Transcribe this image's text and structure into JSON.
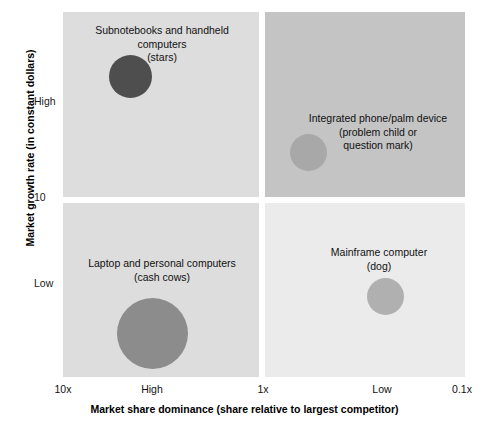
{
  "chart_data": {
    "type": "scatter",
    "title": "",
    "subtitle": "",
    "xlabel": "Market share dominance (share relative to largest competitor)",
    "ylabel": "Market growth rate (in constant dollars)",
    "x_ticks": [
      "10x",
      "High",
      "1x",
      "Low",
      "0.1x"
    ],
    "y_ticks": [
      "High",
      "10",
      "Low"
    ],
    "xlim": [
      "10x",
      "0.1x"
    ],
    "ylim": [
      "Low",
      "High"
    ],
    "grid": false,
    "legend": "none",
    "quadrants": [
      {
        "id": "stars",
        "position": "top-left",
        "fill": "#dddddd",
        "caption": "Subnotebooks and handheld\ncomputers\n(stars)",
        "bubble": {
          "label": "Subnotebooks and handheld computers",
          "category": "stars",
          "x": "High share",
          "y": "High growth",
          "size": 43,
          "color": "#4e4e4e"
        }
      },
      {
        "id": "question",
        "position": "top-right",
        "fill": "#c4c4c4",
        "caption": "Integrated phone/palm device\n(problem child or\nquestion mark)",
        "bubble": {
          "label": "Integrated phone/palm device",
          "category": "problem child or question mark",
          "x": "Low share",
          "y": "High growth",
          "size": 37,
          "color": "#a8a8a8"
        }
      },
      {
        "id": "cashcow",
        "position": "bottom-left",
        "fill": "#dddddd",
        "caption": "Laptop and personal computers\n(cash cows)",
        "bubble": {
          "label": "Laptop and personal computers",
          "category": "cash cows",
          "x": "High share",
          "y": "Low growth",
          "size": 71,
          "color": "#8c8c8c"
        }
      },
      {
        "id": "dog",
        "position": "bottom-right",
        "fill": "#ebebeb",
        "caption": "Mainframe computer\n(dog)",
        "bubble": {
          "label": "Mainframe computer",
          "category": "dog",
          "x": "Low share",
          "y": "Low growth",
          "size": 37,
          "color": "#b0b0b0"
        }
      }
    ]
  },
  "axes": {
    "y": {
      "title": "Market growth rate (in constant dollars)",
      "ticks": {
        "high": "High",
        "mid": "10",
        "low": "Low"
      }
    },
    "x": {
      "title": "Market share dominance (share relative to largest competitor)",
      "ticks": {
        "t0": "10x",
        "t1": "High",
        "t2": "1x",
        "t3": "Low",
        "t4": "0.1x"
      }
    }
  },
  "captions": {
    "stars": "Subnotebooks and handheld\ncomputers\n(stars)",
    "question": "Integrated phone/palm device\n(problem child or\nquestion mark)",
    "cashcow": "Laptop and personal computers\n(cash cows)",
    "dog": "Mainframe computer\n(dog)"
  }
}
